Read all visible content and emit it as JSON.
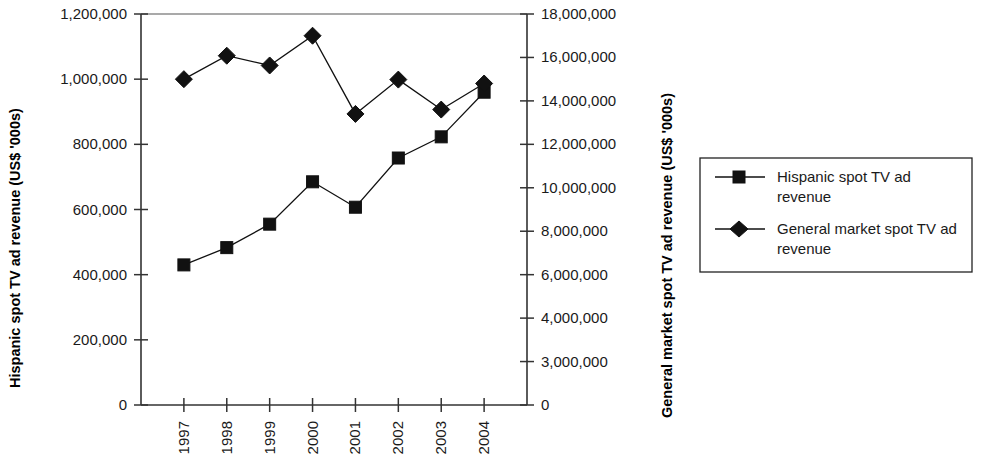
{
  "chart_data": {
    "type": "line",
    "title": "",
    "xlabel": "",
    "ylabel": "Hispanic spot TV ad revenue (US$ '000s)",
    "y2label": "General market spot TV ad revenue (US$ '000s)",
    "categories": [
      "1997",
      "1998",
      "1999",
      "2000",
      "2001",
      "2002",
      "2003",
      "2004"
    ],
    "grid": false,
    "legend_position": "right",
    "ylim": [
      0,
      1200000
    ],
    "y2lim": [
      0,
      18000000
    ],
    "ytick_labels": [
      "0",
      "200,000",
      "400,000",
      "600,000",
      "800,000",
      "1,000,000",
      "1,200,000"
    ],
    "ytick_values": [
      0,
      200000,
      400000,
      600000,
      800000,
      1000000,
      1200000
    ],
    "y2tick_labels": [
      "0",
      "3,000,000",
      "4,000,000",
      "6,000,000",
      "8,000,000",
      "10,000,000",
      "12,000,000",
      "14,000,000",
      "16,000,000",
      "18,000,000"
    ],
    "y2tick_values": [
      0,
      2000000,
      4000000,
      6000000,
      8000000,
      10000000,
      12000000,
      14000000,
      16000000,
      18000000
    ],
    "series": [
      {
        "name": "Hispanic spot TV ad revenue",
        "marker": "square",
        "axis": "left",
        "values": [
          430000,
          483000,
          555000,
          685000,
          607000,
          758000,
          823000,
          960000
        ]
      },
      {
        "name": "General market spot TV ad revenue",
        "marker": "diamond",
        "axis": "right",
        "values": [
          15000000,
          16080000,
          15630000,
          17000000,
          13400000,
          14980000,
          13600000,
          14800000
        ]
      }
    ]
  },
  "legend": {
    "entries": [
      {
        "label_line1": "Hispanic spot TV ad",
        "label_line2": "revenue",
        "marker": "square-marker"
      },
      {
        "label_line1": "General market spot TV ad",
        "label_line2": "revenue",
        "marker": "diamond-marker"
      }
    ]
  },
  "colors": {
    "series": "#111111",
    "axis": "#333333",
    "background": "#ffffff"
  }
}
